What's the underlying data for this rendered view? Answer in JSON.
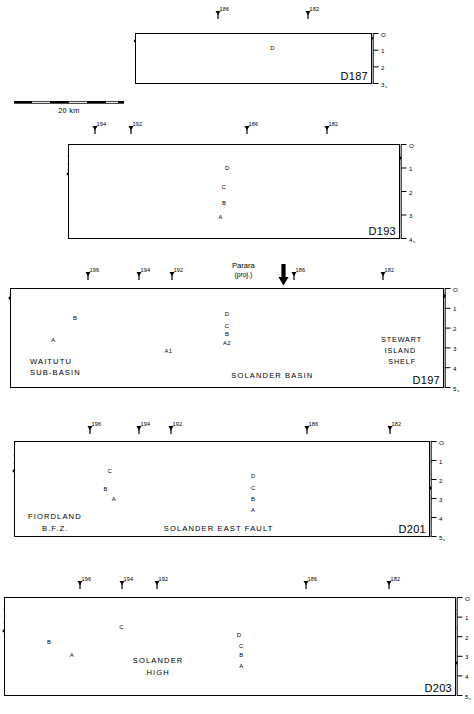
{
  "figure": {
    "depth_axis_unit": "s",
    "scalebar": {
      "label": "20 km",
      "length_km": 20
    },
    "caption": ""
  },
  "axis_ticks": [
    "O",
    "1",
    "2",
    "3",
    "4",
    "5"
  ],
  "panels": [
    {
      "id": "D187",
      "stations": [
        "186",
        "182"
      ],
      "units": [
        "D"
      ],
      "annotations": [],
      "axis_max": 3,
      "axis_labels": [
        "O",
        "1",
        "2",
        "3"
      ]
    },
    {
      "id": "D193",
      "stations": [
        "194",
        "192",
        "186",
        "182"
      ],
      "units": [
        "D",
        "C",
        "B",
        "A"
      ],
      "annotations": [],
      "axis_max": 4,
      "axis_labels": [
        "O",
        "1",
        "2",
        "3",
        "4"
      ]
    },
    {
      "id": "D197",
      "stations": [
        "196",
        "194",
        "192",
        "186",
        "182"
      ],
      "units": [
        "D",
        "C",
        "B",
        "A",
        "A1",
        "A2"
      ],
      "annotations": [
        "WAITUTU SUB-BASIN",
        "SOLANDER BASIN",
        "STEWART ISLAND SHELF"
      ],
      "marker": {
        "label_line1": "Parara",
        "label_line2": "(proj.)",
        "icon": "down-arrow"
      },
      "axis_max": 5,
      "axis_labels": [
        "O",
        "1",
        "2",
        "3",
        "4",
        "5"
      ]
    },
    {
      "id": "D201",
      "stations": [
        "196",
        "194",
        "192",
        "186",
        "182"
      ],
      "units": [
        "C",
        "B",
        "A",
        "D"
      ],
      "annotations": [
        "FIORDLAND",
        "B.F.Z.",
        "SOLANDER EAST FAULT"
      ],
      "axis_max": 5,
      "axis_labels": [
        "O",
        "1",
        "2",
        "3",
        "4",
        "5"
      ]
    },
    {
      "id": "D203",
      "stations": [
        "196",
        "194",
        "192",
        "186",
        "182"
      ],
      "units": [
        "C",
        "B",
        "A",
        "D"
      ],
      "annotations": [
        "SOLANDER HIGH"
      ],
      "axis_max": 5,
      "axis_labels": [
        "O",
        "1",
        "2",
        "3",
        "4",
        "5"
      ]
    }
  ],
  "labels": {
    "waitutu_l1": "WAITUTU",
    "waitutu_l2": "SUB-BASIN",
    "solander_basin": "SOLANDER   BASIN",
    "stewart_l1": "STEWART",
    "stewart_l2": "ISLAND",
    "stewart_l3": "SHELF",
    "fiordland_l1": "FIORDLAND",
    "fiordland_l2": "B.F.Z.",
    "solander_east_fault": "SOLANDER EAST FAULT",
    "solander_high_l1": "SOLANDER",
    "solander_high_l2": "HIGH"
  },
  "colors": {
    "ink": "#000000",
    "basement": "#000000",
    "hachure": "#555555",
    "paper": "#ffffff"
  }
}
